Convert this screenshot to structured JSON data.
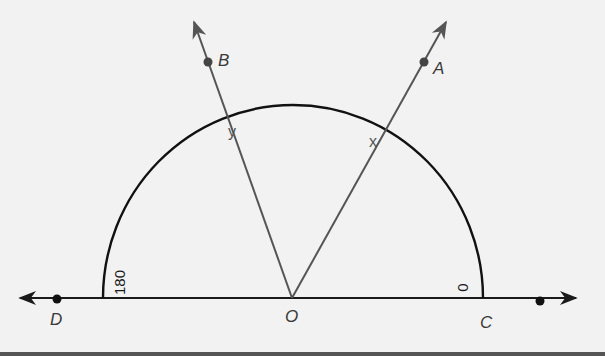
{
  "diagram": {
    "type": "protractor-angle-figure",
    "colors": {
      "background": "#f2f2f2",
      "line": "#1a1a1a",
      "ray": "#555555",
      "point": "#3a3a3a"
    },
    "points": {
      "A": "A",
      "B": "B",
      "C": "C",
      "D": "D",
      "O": "O"
    },
    "ray_marks": {
      "x": "x",
      "y": "y"
    },
    "protractor_scale": {
      "left": "180",
      "right": "0"
    }
  }
}
